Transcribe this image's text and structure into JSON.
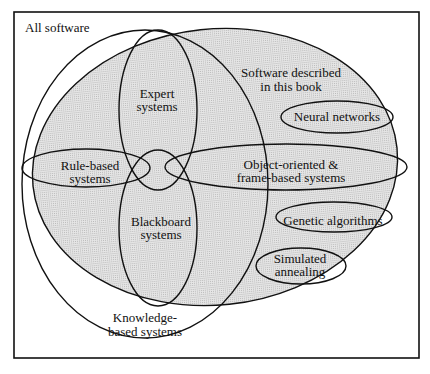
{
  "diagram": {
    "type": "venn",
    "title": "",
    "colors": {
      "shade": "#d9d9d9",
      "stroke": "#111111",
      "frame": "#111111",
      "background": "#ffffff"
    },
    "sets": {
      "all_software": {
        "label": "All software"
      },
      "book": {
        "label_line1": "Software described",
        "label_line2": "in this book"
      },
      "knowledge_based": {
        "label_line1": "Knowledge-",
        "label_line2": "based systems"
      },
      "expert": {
        "label_line1": "Expert",
        "label_line2": "systems"
      },
      "blackboard": {
        "label_line1": "Blackboard",
        "label_line2": "systems"
      },
      "rule_based": {
        "label_line1": "Rule-based",
        "label_line2": "systems"
      },
      "object_oriented": {
        "label_line1": "Object-oriented &",
        "label_line2": "frame-based systems"
      },
      "neural": {
        "label": "Neural networks"
      },
      "genetic": {
        "label": "Genetic algorithms"
      },
      "simulated": {
        "label_line1": "Simulated",
        "label_line2": "annealing"
      }
    }
  }
}
